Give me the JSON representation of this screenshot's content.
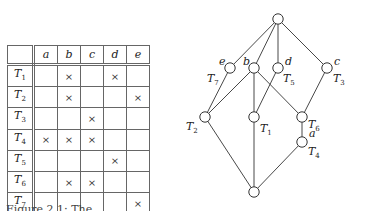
{
  "table": {
    "columns": [
      "a",
      "b",
      "c",
      "d",
      "e"
    ],
    "rows": [
      {
        "label": "T",
        "sub": "1",
        "cells": [
          "",
          "×",
          "",
          "×",
          ""
        ]
      },
      {
        "label": "T",
        "sub": "2",
        "cells": [
          "",
          "×",
          "",
          "",
          "×"
        ]
      },
      {
        "label": "T",
        "sub": "3",
        "cells": [
          "",
          "",
          "×",
          "",
          ""
        ]
      },
      {
        "label": "T",
        "sub": "4",
        "cells": [
          "×",
          "×",
          "×",
          "",
          ""
        ]
      },
      {
        "label": "T",
        "sub": "5",
        "cells": [
          "",
          "",
          "",
          "×",
          ""
        ]
      },
      {
        "label": "T",
        "sub": "6",
        "cells": [
          "",
          "×",
          "×",
          "",
          ""
        ]
      },
      {
        "label": "T",
        "sub": "7",
        "cells": [
          "",
          "",
          "",
          "",
          "×"
        ]
      }
    ]
  },
  "lattice": {
    "nodes": [
      {
        "id": "top",
        "x": 278,
        "y": 19
      },
      {
        "id": "e",
        "x": 230,
        "y": 68
      },
      {
        "id": "b",
        "x": 254,
        "y": 68
      },
      {
        "id": "d",
        "x": 278,
        "y": 68
      },
      {
        "id": "c",
        "x": 327,
        "y": 68
      },
      {
        "id": "T2",
        "x": 205,
        "y": 117
      },
      {
        "id": "T1",
        "x": 254,
        "y": 117
      },
      {
        "id": "T6",
        "x": 302,
        "y": 117
      },
      {
        "id": "T4",
        "x": 302,
        "y": 142
      },
      {
        "id": "bottom",
        "x": 254,
        "y": 192
      }
    ],
    "edges": [
      [
        "top",
        "e"
      ],
      [
        "top",
        "b"
      ],
      [
        "top",
        "d"
      ],
      [
        "top",
        "c"
      ],
      [
        "e",
        "T2"
      ],
      [
        "b",
        "T2"
      ],
      [
        "b",
        "T1"
      ],
      [
        "b",
        "T6"
      ],
      [
        "d",
        "T1"
      ],
      [
        "c",
        "T6"
      ],
      [
        "T6",
        "T4"
      ],
      [
        "T2",
        "bottom"
      ],
      [
        "T1",
        "bottom"
      ],
      [
        "T4",
        "bottom"
      ]
    ],
    "labels": {
      "e": {
        "text": "e"
      },
      "b": {
        "text": "b"
      },
      "d": {
        "text": "d"
      },
      "c": {
        "text": "c"
      },
      "a": {
        "text": "a"
      },
      "T7": {
        "text": "T",
        "sub": "7"
      },
      "T5": {
        "text": "T",
        "sub": "5"
      },
      "T3": {
        "text": "T",
        "sub": "3"
      },
      "T2": {
        "text": "T",
        "sub": "2"
      },
      "T1": {
        "text": "T",
        "sub": "1"
      },
      "T6": {
        "text": "T",
        "sub": "6"
      },
      "T4": {
        "text": "T",
        "sub": "4"
      }
    }
  },
  "caption": "Figure 2.1: The ..."
}
